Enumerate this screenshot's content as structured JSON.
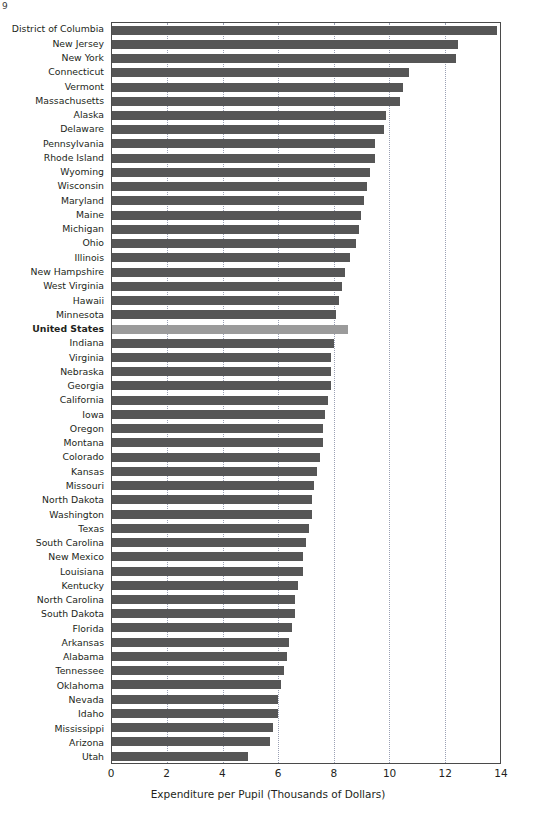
{
  "corner_mark": "9",
  "chart_data": {
    "type": "bar",
    "orientation": "horizontal",
    "title": "",
    "subtitle": "",
    "xlabel": "Expenditure per Pupil (Thousands of Dollars)",
    "ylabel": "",
    "xlim": [
      0,
      14
    ],
    "xticks": [
      0,
      2,
      4,
      6,
      8,
      10,
      12,
      14
    ],
    "xtick_labels": [
      "0",
      "2",
      "4",
      "6",
      "8",
      "10",
      "12",
      "14"
    ],
    "grid": "vertical-dotted",
    "legend": "none",
    "highlight_category": "United States",
    "colors": {
      "bar": "#565656",
      "bar_highlight": "#9b9b9b",
      "gridline": "#9aa0b4",
      "axis": "#4a4a4a",
      "text": "#231f20"
    },
    "categories": [
      "District of Columbia",
      "New Jersey",
      "New York",
      "Connecticut",
      "Vermont",
      "Massachusetts",
      "Alaska",
      "Delaware",
      "Pennsylvania",
      "Rhode Island",
      "Wyoming",
      "Wisconsin",
      "Maryland",
      "Maine",
      "Michigan",
      "Ohio",
      "Illinois",
      "New Hampshire",
      "West Virginia",
      "Hawaii",
      "Minnesota",
      "United States",
      "Indiana",
      "Virginia",
      "Nebraska",
      "Georgia",
      "California",
      "Iowa",
      "Oregon",
      "Montana",
      "Colorado",
      "Kansas",
      "Missouri",
      "North Dakota",
      "Washington",
      "Texas",
      "South Carolina",
      "New Mexico",
      "Louisiana",
      "Kentucky",
      "North Carolina",
      "South Dakota",
      "Florida",
      "Arkansas",
      "Alabama",
      "Tennessee",
      "Oklahoma",
      "Nevada",
      "Idaho",
      "Mississippi",
      "Arizona",
      "Utah"
    ],
    "values": [
      13.9,
      12.5,
      12.4,
      10.7,
      10.5,
      10.4,
      9.9,
      9.8,
      9.5,
      9.5,
      9.3,
      9.2,
      9.1,
      9.0,
      8.9,
      8.8,
      8.6,
      8.4,
      8.3,
      8.2,
      8.1,
      8.5,
      8.0,
      7.9,
      7.9,
      7.9,
      7.8,
      7.7,
      7.6,
      7.6,
      7.5,
      7.4,
      7.3,
      7.2,
      7.2,
      7.1,
      7.0,
      6.9,
      6.9,
      6.7,
      6.6,
      6.6,
      6.5,
      6.4,
      6.3,
      6.2,
      6.1,
      6.0,
      6.0,
      5.8,
      5.7,
      4.9
    ]
  }
}
